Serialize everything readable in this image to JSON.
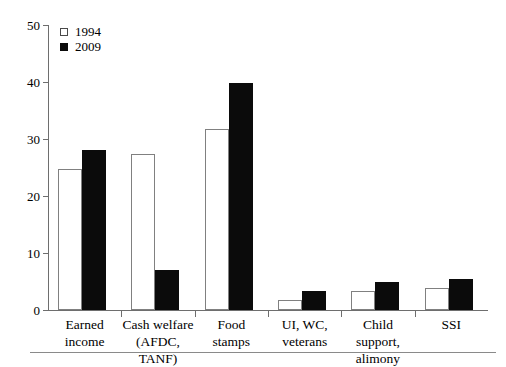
{
  "chart_data": {
    "type": "bar",
    "title": "",
    "subtitle": "",
    "xlabel": "",
    "ylabel": "",
    "ylim": [
      0,
      50
    ],
    "yticks": [
      0,
      10,
      20,
      30,
      40,
      50
    ],
    "ytick_labels": [
      "0",
      "10",
      "20",
      "30",
      "40",
      "50"
    ],
    "grid": false,
    "legend_position": "top-left",
    "categories": [
      "Earned income",
      "Cash welfare (AFDC, TANF)",
      "Food stamps",
      "UI, WC, veterans",
      "Child support, alimony",
      "SSI"
    ],
    "category_lines": [
      [
        "Earned",
        "income"
      ],
      [
        "Cash welfare",
        "(AFDC, TANF)"
      ],
      [
        "Food",
        "stamps"
      ],
      [
        "UI, WC,",
        "veterans"
      ],
      [
        "Child support,",
        "alimony"
      ],
      [
        "SSI",
        ""
      ]
    ],
    "series": [
      {
        "name": "1994",
        "color": "#ffffff",
        "edge_color": "#808080",
        "values": [
          24.8,
          27.4,
          31.7,
          1.7,
          3.3,
          3.8
        ]
      },
      {
        "name": "2009",
        "color": "#0b0b0b",
        "edge_color": "#0b0b0b",
        "values": [
          28.0,
          7.0,
          39.8,
          3.3,
          5.0,
          5.5
        ]
      }
    ]
  },
  "legend": {
    "items": [
      {
        "label": "1994",
        "marker": "hollow-square"
      },
      {
        "label": "2009",
        "marker": "filled-square"
      }
    ]
  }
}
